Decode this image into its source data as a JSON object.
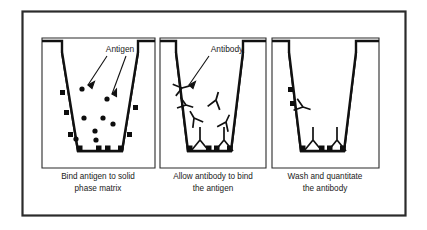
{
  "figure": {
    "background_color": "#ffffff",
    "ink_color": "#111111",
    "frame": {
      "x": 22,
      "y": 11,
      "width": 384,
      "height": 205
    }
  },
  "panels": [
    {
      "id": "panel-1",
      "index": 1,
      "caption_line1": "Bind antigen to solid",
      "caption_line2": "phase matrix",
      "callout_label": "Antigen",
      "callout_arrow_count": 2,
      "well": {
        "top_left_x": 52,
        "top_right_x": 146,
        "bottom_left_x": 76,
        "bottom_right_x": 124,
        "top_y": 52,
        "bottom_y": 152
      },
      "free_antigen_dots": [
        {
          "x": 82,
          "y": 89
        },
        {
          "x": 107,
          "y": 99
        },
        {
          "x": 84,
          "y": 118
        },
        {
          "x": 103,
          "y": 118
        },
        {
          "x": 113,
          "y": 124
        },
        {
          "x": 95,
          "y": 131
        },
        {
          "x": 96,
          "y": 140
        },
        {
          "x": 76,
          "y": 139
        }
      ],
      "bound_wall_dots": [
        {
          "x": 62,
          "y": 93
        },
        {
          "x": 67,
          "y": 113
        },
        {
          "x": 71,
          "y": 135
        },
        {
          "x": 136,
          "y": 108
        },
        {
          "x": 130,
          "y": 135
        }
      ],
      "bound_bottom_dots": [
        {
          "x": 79,
          "y": 149
        },
        {
          "x": 99,
          "y": 149
        },
        {
          "x": 108,
          "y": 149
        },
        {
          "x": 121,
          "y": 149
        }
      ]
    },
    {
      "id": "panel-2",
      "index": 2,
      "caption_line1": "Allow antibody to bind",
      "caption_line2": "the antigen",
      "callout_label": "Antibody",
      "callout_arrow_count": 1,
      "well": {
        "top_left_x": 163,
        "top_right_x": 254,
        "bottom_left_x": 186,
        "bottom_right_x": 233,
        "top_y": 52,
        "bottom_y": 152
      },
      "free_antibodies": [
        {
          "x": 181,
          "y": 88,
          "rotation": 255,
          "scale": 1.0
        },
        {
          "x": 185,
          "y": 104,
          "rotation": 285,
          "scale": 0.95
        },
        {
          "x": 216,
          "y": 100,
          "rotation": 195,
          "scale": 1.05
        },
        {
          "x": 193,
          "y": 118,
          "rotation": 150,
          "scale": 1.0
        },
        {
          "x": 225,
          "y": 122,
          "rotation": 205,
          "scale": 1.0
        }
      ],
      "bound_antibodies": [
        {
          "x": 200,
          "y": 150,
          "rotation": 0,
          "scale": 1.0
        },
        {
          "x": 224,
          "y": 150,
          "rotation": 0,
          "scale": 1.0
        }
      ],
      "bound_bottom_dots": [
        {
          "x": 190,
          "y": 149
        },
        {
          "x": 210,
          "y": 149
        },
        {
          "x": 216,
          "y": 149
        },
        {
          "x": 231,
          "y": 149
        }
      ]
    },
    {
      "id": "panel-3",
      "index": 3,
      "caption_line1": "Wash and quantitate",
      "caption_line2": "the antibody",
      "callout_label": "",
      "callout_arrow_count": 0,
      "well": {
        "top_left_x": 276,
        "top_right_x": 368,
        "bottom_left_x": 299,
        "bottom_right_x": 346,
        "top_y": 52,
        "bottom_y": 152
      },
      "free_antibodies": [
        {
          "x": 302,
          "y": 106,
          "rotation": 285,
          "scale": 1.0
        }
      ],
      "bound_antibodies": [
        {
          "x": 313,
          "y": 150,
          "rotation": 0,
          "scale": 1.0
        },
        {
          "x": 337,
          "y": 150,
          "rotation": 0,
          "scale": 1.0
        }
      ],
      "bound_wall_dots": [
        {
          "x": 287,
          "y": 90
        },
        {
          "x": 292,
          "y": 104
        }
      ],
      "bound_bottom_dots": [
        {
          "x": 303,
          "y": 149
        },
        {
          "x": 323,
          "y": 149
        },
        {
          "x": 329,
          "y": 149
        },
        {
          "x": 344,
          "y": 149
        }
      ]
    }
  ]
}
